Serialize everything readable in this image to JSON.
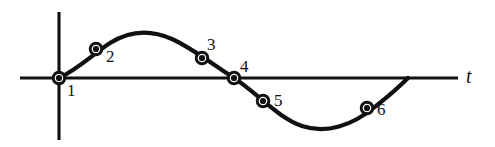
{
  "figure": {
    "background_color": "#ffffff",
    "ink_color": "#111111",
    "width": 495,
    "height": 147
  },
  "axes": {
    "horizontal": {
      "label": "t",
      "label_x": 466,
      "label_y": 66,
      "x_start": 20,
      "x_end": 458,
      "y": 78
    },
    "vertical": {
      "label": "",
      "x": 59,
      "y_start": 12,
      "y_end": 140
    },
    "origin": {
      "x": 59,
      "y": 78
    }
  },
  "chart_data": {
    "type": "line",
    "xlabel": "t",
    "ylabel": "",
    "grid": false,
    "legend": null,
    "curve_style": "smooth sine-like curve, one full period",
    "curve_svg_path": "M 59 78 C 78 69 92 55 110 43 C 132 29 152 30 172 39 C 192 48 212 64 234 78 C 256 92 278 118 302 126 C 326 134 352 126 376 106 C 390 95 399 87 408 78",
    "points": [
      {
        "label": "1",
        "x": 59,
        "y": 78,
        "label_x": 67,
        "label_y": 82
      },
      {
        "label": "2",
        "x": 96,
        "y": 49,
        "label_x": 106,
        "label_y": 48
      },
      {
        "label": "3",
        "x": 202,
        "y": 58,
        "label_x": 207,
        "label_y": 36
      },
      {
        "label": "4",
        "x": 234,
        "y": 78,
        "label_x": 240,
        "label_y": 58
      },
      {
        "label": "5",
        "x": 263,
        "y": 101,
        "label_x": 274,
        "label_y": 92
      },
      {
        "label": "6",
        "x": 367,
        "y": 108,
        "label_x": 377,
        "label_y": 101
      }
    ],
    "marker_style": {
      "outer_radius": 7.2,
      "gap_radius": 4.6,
      "dot_radius": 3.1
    }
  }
}
